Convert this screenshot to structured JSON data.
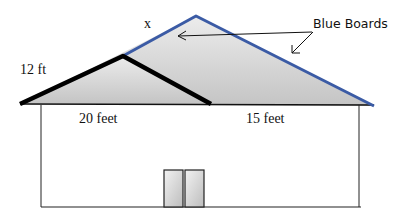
{
  "diagram": {
    "title": "",
    "labels": {
      "x": "x",
      "height_small_roof": "12 ft",
      "width_left": "20 feet",
      "width_right": "15 feet",
      "blue_boards": "Blue Boards"
    },
    "colors": {
      "roof_fill": "#d4d4d4",
      "blue_board": "#3b5ba5",
      "outline": "#000000",
      "door_fill": "#d0d0d0"
    },
    "shapes": {
      "big_roof": {
        "left": [
          20,
          104
        ],
        "apex": [
          196,
          16
        ],
        "right": [
          374,
          106
        ]
      },
      "small_roof": {
        "left": [
          20,
          104
        ],
        "apex": [
          123,
          56
        ],
        "right": [
          211,
          104
        ]
      },
      "wall": {
        "x1": 41,
        "x2": 359,
        "top": 105,
        "bottom": 207
      },
      "doors": [
        {
          "x": 164,
          "y": 170,
          "w": 19,
          "h": 37
        },
        {
          "x": 185,
          "y": 170,
          "w": 19,
          "h": 37
        }
      ]
    }
  }
}
